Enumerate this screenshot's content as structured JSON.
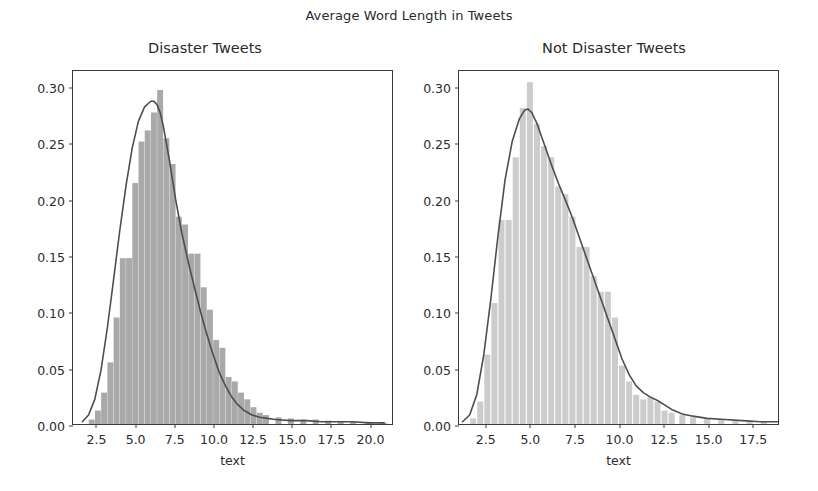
{
  "figure": {
    "suptitle": "Average Word Length in Tweets",
    "background": "#ffffff"
  },
  "chart_data": [
    {
      "type": "histogram",
      "title": "Disaster Tweets",
      "xlabel": "text",
      "ylabel": "",
      "xlim": [
        1.0,
        21.5
      ],
      "ylim": [
        0.0,
        0.315
      ],
      "grid": false,
      "legend": null,
      "xticks": [
        "2.5",
        "5.0",
        "7.5",
        "10.0",
        "12.5",
        "15.0",
        "17.5",
        "20.0"
      ],
      "xtick_values": [
        2.5,
        5.0,
        7.5,
        10.0,
        12.5,
        15.0,
        17.5,
        20.0
      ],
      "yticks": [
        "0.00",
        "0.05",
        "0.10",
        "0.15",
        "0.20",
        "0.25",
        "0.30"
      ],
      "ytick_values": [
        0.0,
        0.05,
        0.1,
        0.15,
        0.2,
        0.25,
        0.3
      ],
      "bar_color": "#a9a9a9",
      "line_color": "#4d4d4d",
      "bin_width": 0.38,
      "bin_centers": [
        2.2,
        2.6,
        3.0,
        3.4,
        3.8,
        4.2,
        4.6,
        5.0,
        5.4,
        5.8,
        6.2,
        6.6,
        7.0,
        7.4,
        7.8,
        8.2,
        8.6,
        9.0,
        9.4,
        9.8,
        10.2,
        10.6,
        11.0,
        11.4,
        11.8,
        12.2,
        12.6,
        13.0,
        13.4,
        14.2,
        15.0,
        15.8,
        16.6,
        17.4,
        18.2,
        19.0,
        20.0,
        21.0
      ],
      "bin_values": [
        0.004,
        0.012,
        0.028,
        0.055,
        0.095,
        0.148,
        0.148,
        0.215,
        0.252,
        0.262,
        0.278,
        0.298,
        0.255,
        0.232,
        0.185,
        0.178,
        0.152,
        0.152,
        0.122,
        0.102,
        0.075,
        0.068,
        0.042,
        0.038,
        0.028,
        0.022,
        0.015,
        0.01,
        0.008,
        0.006,
        0.005,
        0.004,
        0.004,
        0.003,
        0.002,
        0.002,
        0.002,
        0.001
      ],
      "kde_x": [
        1.6,
        2.0,
        2.4,
        2.8,
        3.2,
        3.6,
        4.0,
        4.4,
        4.8,
        5.2,
        5.6,
        6.0,
        6.2,
        6.4,
        6.6,
        6.8,
        7.2,
        7.6,
        8.0,
        8.4,
        8.8,
        9.2,
        9.6,
        10.0,
        10.4,
        10.8,
        11.2,
        11.6,
        12.0,
        12.5,
        13.0,
        13.5,
        14.0,
        15.0,
        16.0,
        17.0,
        18.0,
        19.0,
        20.0,
        21.0
      ],
      "kde_y": [
        0.002,
        0.008,
        0.022,
        0.048,
        0.085,
        0.128,
        0.172,
        0.212,
        0.246,
        0.27,
        0.283,
        0.288,
        0.288,
        0.285,
        0.278,
        0.266,
        0.235,
        0.2,
        0.17,
        0.145,
        0.122,
        0.1,
        0.08,
        0.062,
        0.046,
        0.034,
        0.024,
        0.017,
        0.012,
        0.008,
        0.006,
        0.005,
        0.004,
        0.003,
        0.003,
        0.002,
        0.002,
        0.002,
        0.001,
        0.001
      ]
    },
    {
      "type": "histogram",
      "title": "Not Disaster Tweets",
      "xlabel": "text",
      "ylabel": "",
      "xlim": [
        1.0,
        19.0
      ],
      "ylim": [
        0.0,
        0.315
      ],
      "grid": false,
      "legend": null,
      "xticks": [
        "2.5",
        "5.0",
        "7.5",
        "10.0",
        "12.5",
        "15.0",
        "17.5"
      ],
      "xtick_values": [
        2.5,
        5.0,
        7.5,
        10.0,
        12.5,
        15.0,
        17.5
      ],
      "yticks": [
        "0.00",
        "0.05",
        "0.10",
        "0.15",
        "0.20",
        "0.25",
        "0.30"
      ],
      "ytick_values": [
        0.0,
        0.05,
        0.1,
        0.15,
        0.2,
        0.25,
        0.3
      ],
      "bar_color": "#cccccc",
      "line_color": "#4d4d4d",
      "bin_width": 0.34,
      "bin_centers": [
        1.8,
        2.2,
        2.6,
        3.0,
        3.4,
        3.8,
        4.2,
        4.6,
        5.0,
        5.4,
        5.8,
        6.2,
        6.6,
        7.0,
        7.4,
        7.8,
        8.2,
        8.6,
        9.0,
        9.4,
        9.8,
        10.2,
        10.6,
        11.0,
        11.4,
        11.8,
        12.2,
        12.6,
        13.0,
        13.6,
        14.2,
        15.0,
        15.8,
        16.6,
        17.4,
        18.2
      ],
      "bin_values": [
        0.005,
        0.02,
        0.062,
        0.108,
        0.182,
        0.182,
        0.238,
        0.282,
        0.305,
        0.268,
        0.248,
        0.238,
        0.212,
        0.205,
        0.185,
        0.158,
        0.158,
        0.132,
        0.118,
        0.118,
        0.095,
        0.052,
        0.038,
        0.026,
        0.022,
        0.024,
        0.02,
        0.012,
        0.01,
        0.008,
        0.006,
        0.005,
        0.004,
        0.003,
        0.003,
        0.002
      ],
      "kde_x": [
        1.2,
        1.6,
        2.0,
        2.4,
        2.8,
        3.2,
        3.6,
        4.0,
        4.4,
        4.7,
        4.9,
        5.1,
        5.4,
        5.8,
        6.2,
        6.6,
        7.0,
        7.4,
        7.8,
        8.2,
        8.6,
        9.0,
        9.4,
        9.8,
        10.2,
        10.6,
        11.0,
        11.4,
        11.8,
        12.2,
        12.6,
        13.0,
        13.6,
        14.2,
        15.0,
        16.0,
        17.0,
        18.0,
        19.0
      ],
      "kde_y": [
        0.002,
        0.008,
        0.026,
        0.062,
        0.112,
        0.168,
        0.218,
        0.252,
        0.272,
        0.28,
        0.281,
        0.278,
        0.268,
        0.25,
        0.232,
        0.215,
        0.2,
        0.184,
        0.166,
        0.148,
        0.13,
        0.112,
        0.094,
        0.076,
        0.058,
        0.044,
        0.034,
        0.028,
        0.024,
        0.021,
        0.017,
        0.013,
        0.009,
        0.007,
        0.005,
        0.004,
        0.003,
        0.002,
        0.002
      ]
    }
  ]
}
